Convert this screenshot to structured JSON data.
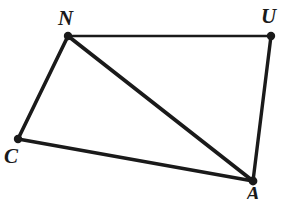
{
  "figure": {
    "kind": "geometry-diagram",
    "shape_name": "quadrilateral CNUA with diagonal NA",
    "background_color": "#ffffff",
    "stroke_color": "#1a1a1a",
    "width": 281,
    "height": 199,
    "vertices": [
      {
        "id": "N",
        "label": "N",
        "x": 68,
        "y": 36,
        "dot_radius": 4.2,
        "label_x": 58,
        "label_y": 8
      },
      {
        "id": "U",
        "label": "U",
        "x": 271,
        "y": 36,
        "dot_radius": 4.2,
        "label_x": 261,
        "label_y": 6
      },
      {
        "id": "C",
        "label": "C",
        "x": 18,
        "y": 139,
        "dot_radius": 4.2,
        "label_x": 4,
        "label_y": 146
      },
      {
        "id": "A",
        "label": "A",
        "x": 253,
        "y": 181,
        "dot_radius": 4.4,
        "label_x": 246,
        "label_y": 184
      }
    ],
    "edges": [
      {
        "id": "NU",
        "from": "N",
        "to": "U",
        "x1": 68,
        "y1": 36,
        "x2": 271,
        "y2": 36,
        "stroke_width": 2.6
      },
      {
        "id": "UA",
        "from": "U",
        "to": "A",
        "x1": 271,
        "y1": 36,
        "x2": 253,
        "y2": 181,
        "stroke_width": 3.4
      },
      {
        "id": "CA",
        "from": "C",
        "to": "A",
        "x1": 18,
        "y1": 139,
        "x2": 253,
        "y2": 181,
        "stroke_width": 3.4
      },
      {
        "id": "NC",
        "from": "N",
        "to": "C",
        "x1": 68,
        "y1": 36,
        "x2": 18,
        "y2": 139,
        "stroke_width": 3.6
      },
      {
        "id": "NA",
        "from": "N",
        "to": "A",
        "x1": 68,
        "y1": 36,
        "x2": 253,
        "y2": 181,
        "stroke_width": 3.8
      }
    ]
  }
}
